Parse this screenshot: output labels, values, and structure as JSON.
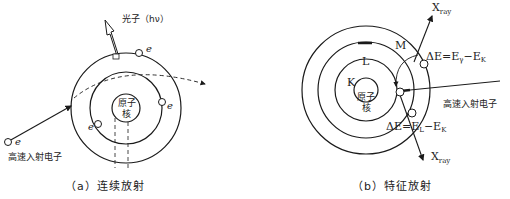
{
  "diagram_a": {
    "photon_label": "光子（hν）",
    "nucleus_line1": "原子",
    "nucleus_line2": "核",
    "electron_label": "e",
    "incident_label": "高速入射电子",
    "caption": "（a）连续放射"
  },
  "diagram_b": {
    "shell_k": "K",
    "shell_l": "L",
    "shell_m": "M",
    "nucleus_line1": "原子",
    "nucleus_line2": "核",
    "xray_top": "X",
    "xray_top_sub": "ray",
    "xray_bottom": "X",
    "xray_bottom_sub": "ray",
    "delta_top": "ΔE=E",
    "delta_top_sub1": "γ",
    "delta_top_mid": "−E",
    "delta_top_sub2": "K",
    "delta_bottom": "ΔE=E",
    "delta_bottom_sub1": "L",
    "delta_bottom_mid": "−E",
    "delta_bottom_sub2": "K",
    "incident_label": "高速入射电子",
    "caption": "（b）特征放射"
  },
  "colors": {
    "line": "#1a1a1a",
    "background": "#ffffff"
  }
}
